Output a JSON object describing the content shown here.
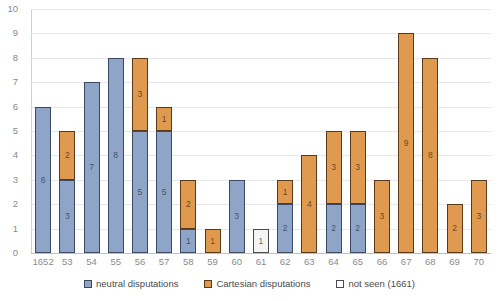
{
  "chart_data": {
    "type": "bar",
    "subtype": "stacked",
    "title": "",
    "xlabel": "",
    "ylabel": "",
    "ylim": [
      0,
      10
    ],
    "ytick_step": 1,
    "grid": true,
    "legend_position": "bottom",
    "categories": [
      "1652",
      "53",
      "54",
      "55",
      "56",
      "57",
      "58",
      "59",
      "60",
      "61",
      "62",
      "63",
      "64",
      "65",
      "66",
      "67",
      "68",
      "69",
      "70"
    ],
    "series": [
      {
        "name": "neutral disputations",
        "color": "#8ea5c8",
        "border_color": "#3a4a63",
        "values": [
          6,
          3,
          7,
          8,
          5,
          5,
          1,
          0,
          3,
          0,
          2,
          0,
          2,
          2,
          0,
          0,
          0,
          0,
          0
        ]
      },
      {
        "name": "Cartesian disputations",
        "color": "#e09a50",
        "border_color": "#5a3a18",
        "values": [
          0,
          2,
          0,
          0,
          3,
          1,
          2,
          1,
          0,
          0,
          1,
          4,
          3,
          3,
          3,
          9,
          8,
          2,
          3
        ]
      },
      {
        "name": "not seen (1661)",
        "color": "#ffffff",
        "border_color": "#4a4a4a",
        "values": [
          0,
          0,
          0,
          0,
          0,
          0,
          0,
          0,
          0,
          1,
          0,
          0,
          0,
          0,
          0,
          0,
          0,
          0,
          0
        ]
      }
    ],
    "totals": [
      6,
      5,
      7,
      8,
      8,
      6,
      3,
      1,
      3,
      1,
      3,
      4,
      5,
      5,
      3,
      9,
      8,
      2,
      3
    ],
    "yticks": [
      "0",
      "1",
      "2",
      "3",
      "4",
      "5",
      "6",
      "7",
      "8",
      "9",
      "10"
    ]
  },
  "legend": {
    "items": [
      {
        "label": "neutral disputations",
        "key": "neutral"
      },
      {
        "label": "Cartesian disputations",
        "key": "cartesian"
      },
      {
        "label": "not seen (1661)",
        "key": "notseen"
      }
    ]
  }
}
